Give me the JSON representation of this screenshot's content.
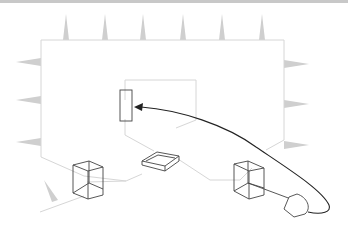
{
  "diagram": {
    "colors": {
      "outline": "#d6d6d6",
      "spikes": "#cfcfcf",
      "wireframe": "#444444",
      "arrow": "#222222",
      "background": "#ffffff"
    },
    "elements": {
      "spikes_top_count": 6,
      "spikes_left_count": 3,
      "spikes_right_count": 3,
      "boxes": [
        "left-tall-box",
        "center-flat-tray",
        "right-tall-box"
      ],
      "connector": "plug",
      "arrow_target": "target-panel"
    }
  }
}
